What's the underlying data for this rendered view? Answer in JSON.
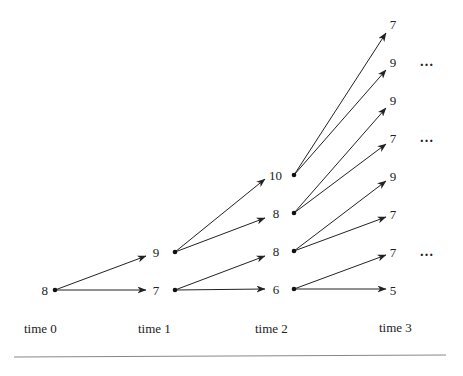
{
  "diagram": {
    "type": "binomial-tree",
    "time_labels": [
      "time 0",
      "time 1",
      "time 2",
      "time 3"
    ],
    "levels": [
      {
        "time": 0,
        "nodes": [
          {
            "id": "t0n0",
            "value": "8",
            "x": 55,
            "y": 290
          }
        ]
      },
      {
        "time": 1,
        "nodes": [
          {
            "id": "t1n0",
            "value": "9",
            "x": 175,
            "y": 252
          },
          {
            "id": "t1n1",
            "value": "7",
            "x": 175,
            "y": 290
          }
        ]
      },
      {
        "time": 2,
        "nodes": [
          {
            "id": "t2n0",
            "value": "10",
            "x": 294,
            "y": 175
          },
          {
            "id": "t2n1",
            "value": "8",
            "x": 294,
            "y": 213
          },
          {
            "id": "t2n2",
            "value": "8",
            "x": 294,
            "y": 251
          },
          {
            "id": "t2n3",
            "value": "6",
            "x": 294,
            "y": 289
          }
        ]
      },
      {
        "time": 3,
        "nodes": [
          {
            "id": "t3n0",
            "value": "7",
            "y": 24
          },
          {
            "id": "t3n1",
            "value": "9",
            "y": 62
          },
          {
            "id": "t3n2",
            "value": "9",
            "y": 100
          },
          {
            "id": "t3n3",
            "value": "7",
            "y": 138
          },
          {
            "id": "t3n4",
            "value": "9",
            "y": 176
          },
          {
            "id": "t3n5",
            "value": "7",
            "y": 214
          },
          {
            "id": "t3n6",
            "value": "7",
            "y": 252
          },
          {
            "id": "t3n7",
            "value": "5",
            "y": 290
          }
        ]
      }
    ],
    "edges": [
      [
        "t0n0",
        "t1n0"
      ],
      [
        "t0n0",
        "t1n1"
      ],
      [
        "t1n0",
        "t2n0"
      ],
      [
        "t1n0",
        "t2n1"
      ],
      [
        "t1n1",
        "t2n2"
      ],
      [
        "t1n1",
        "t2n3"
      ],
      [
        "t2n0",
        "t3n0"
      ],
      [
        "t2n0",
        "t3n1"
      ],
      [
        "t2n1",
        "t3n2"
      ],
      [
        "t2n1",
        "t3n3"
      ],
      [
        "t2n2",
        "t3n4"
      ],
      [
        "t2n2",
        "t3n5"
      ],
      [
        "t2n3",
        "t3n6"
      ],
      [
        "t2n3",
        "t3n7"
      ]
    ],
    "ellipsis": "…",
    "ellipsis_rows": [
      "t3n1",
      "t3n3",
      "t3n6"
    ]
  }
}
